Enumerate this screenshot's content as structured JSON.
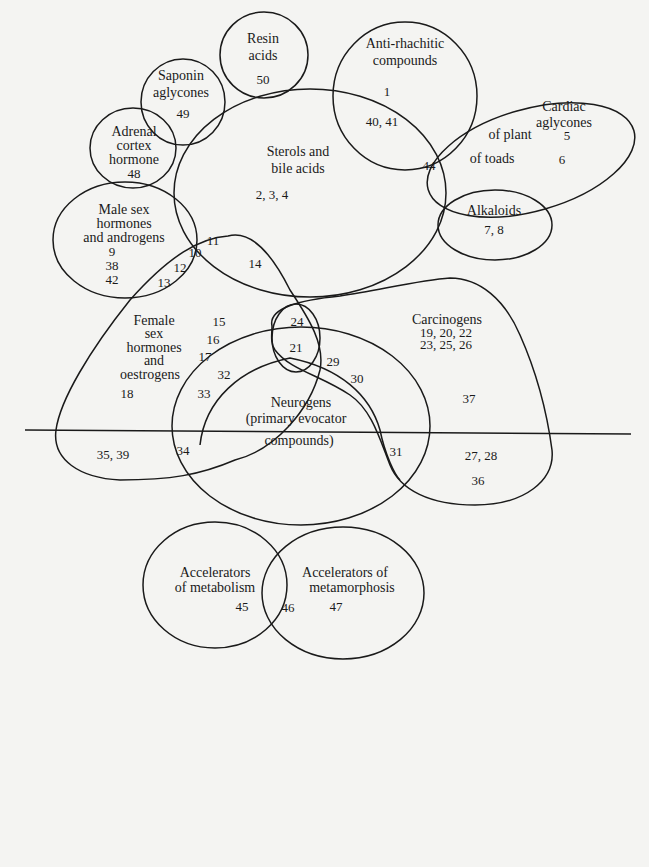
{
  "diagram": {
    "type": "venn-euler",
    "sets": {
      "resin": {
        "title": [
          "Resin",
          "acids"
        ],
        "members": "50"
      },
      "saponin": {
        "title": [
          "Saponin",
          "aglycones"
        ],
        "members": "49"
      },
      "adrenal": {
        "title": [
          "Adrenal",
          "cortex",
          "hormone"
        ],
        "members": "48"
      },
      "antirhachitic": {
        "title": [
          "Anti-rhachitic",
          "compounds"
        ],
        "members": "1",
        "overlap_sterols": "40, 41"
      },
      "cardiac": {
        "title": [
          "Cardiac",
          "aglycones"
        ],
        "plant_label": "of plant",
        "plant_members": "5",
        "toads_label": "of toads",
        "toads_members": "6",
        "overlap_sterols": "44"
      },
      "sterols": {
        "title": [
          "Sterols and",
          "bile acids"
        ],
        "members": "2, 3, 4"
      },
      "alkaloids": {
        "title": [
          "Alkaloids"
        ],
        "members": "7, 8"
      },
      "male": {
        "title": [
          "Male sex",
          "hormones",
          "and androgens"
        ],
        "members": [
          "9",
          "38",
          "42"
        ]
      },
      "female": {
        "title": [
          "Female",
          "sex",
          "hormones",
          "and",
          "oestrogens"
        ],
        "members": [
          "15",
          "16",
          "17",
          "18"
        ],
        "lower_members": "35, 39"
      },
      "carcinogens": {
        "title": [
          "Carcinogens"
        ],
        "members": [
          "19, 20, 22",
          "23, 25, 26"
        ],
        "outer_members": [
          "37",
          "27, 28",
          "36"
        ]
      },
      "neurogens": {
        "title": [
          "Neurogens",
          "(primary evocator",
          "compounds)"
        ]
      },
      "metabolism": {
        "title": [
          "Accelerators",
          "of metabolism"
        ],
        "members": "45"
      },
      "metamorphosis": {
        "title": [
          "Accelerators of",
          "metamorphosis"
        ],
        "members": "47"
      }
    },
    "overlaps": {
      "male_female_sterols": "11",
      "male_female_a": "10",
      "male_female_b": "12",
      "male_female_c": "13",
      "female_sterols": "14",
      "female_carc": "24",
      "female_carc_neuro": "21",
      "carc_neuro_a": "29",
      "carc_neuro_b": "30",
      "carc_neuro_c": "31",
      "female_neuro_a": "32",
      "female_neuro_b": "33",
      "female_neuro_c": "34",
      "metabolism_metamorphosis": "46"
    }
  }
}
